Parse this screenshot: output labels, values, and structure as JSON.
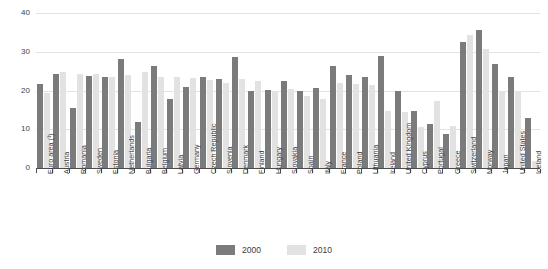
{
  "chart_data": {
    "type": "bar",
    "title": "",
    "subtitle": "",
    "xlabel": "",
    "ylabel": "",
    "ylim": [
      0,
      40
    ],
    "yticks": [
      0,
      10,
      20,
      30,
      40
    ],
    "ytick_labels": [
      "0",
      "10",
      "20",
      "30",
      "40"
    ],
    "grid": true,
    "legend_position": "bottom",
    "categories": [
      "Euro area (¹)",
      "Austria",
      "Romania",
      "Sweden",
      "Estonia",
      "Netherlands",
      "Bulgaria",
      "Belgium",
      "Latvia",
      "Germany",
      "Czech Republic",
      "Slovenia",
      "Denmark",
      "Finland",
      "Hungary",
      "Slovakia",
      "Spain",
      "Italy",
      "France",
      "Poland",
      "Lithuania",
      "Ireland",
      "United Kingdom",
      "Cyprus",
      "Portugal",
      "Greece",
      "Switzerland",
      "Norway",
      "Japan",
      "United States",
      "Iceland"
    ],
    "series": [
      {
        "name": "2000",
        "color": "#7b7b7b",
        "values": [
          21.8,
          24.3,
          15.6,
          23.7,
          23.4,
          28.2,
          12.0,
          26.3,
          17.7,
          21.0,
          23.6,
          23.0,
          28.6,
          19.9,
          20.2,
          22.4,
          19.9,
          20.7,
          26.3,
          24.1,
          23.6,
          28.8,
          19.9,
          14.6,
          11.3,
          8.9,
          32.4,
          35.6,
          26.8,
          23.4,
          12.8
        ]
      },
      {
        "name": "2010",
        "color": "#e2e2e2",
        "values": [
          19.3,
          24.8,
          24.2,
          24.2,
          23.6,
          24.1,
          24.8,
          23.4,
          23.6,
          23.2,
          22.8,
          22.0,
          23.0,
          22.5,
          20.0,
          20.5,
          18.6,
          17.9,
          22.0,
          21.8,
          21.5,
          14.8,
          14.5,
          10.6,
          17.2,
          10.8,
          34.3,
          30.7,
          19.8,
          19.5,
          1.7
        ]
      }
    ]
  },
  "legend": {
    "items": [
      {
        "label": "2000",
        "color": "#7b7b7b"
      },
      {
        "label": "2010",
        "color": "#e2e2e2"
      }
    ]
  }
}
